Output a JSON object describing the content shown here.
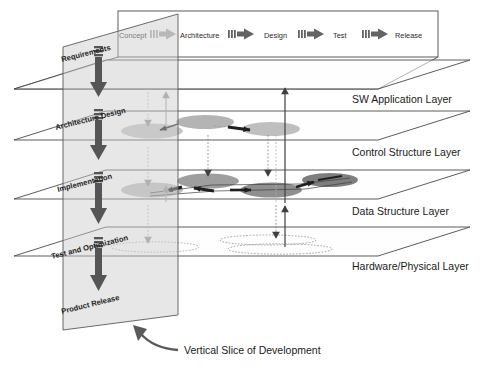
{
  "diagram": {
    "title": "Vertical Slice of Development",
    "caption": "Vertical Slice of Development",
    "colors": {
      "outline": "#4a4a4a",
      "plane_fill": "#fdfdfd",
      "slice_fill": "#e8e8e8",
      "node_light": "#c9c9c9",
      "node_mid": "#a8a8a8",
      "node_dark": "#808080",
      "arrow_dark": "#5a5a5a",
      "arrow_light": "#b5b5b5",
      "text": "#1a1a1a"
    }
  },
  "process_flow": {
    "steps": [
      {
        "label": "Concept",
        "faded": true
      },
      {
        "label": "Architecture",
        "faded": false
      },
      {
        "label": "Design",
        "faded": false
      },
      {
        "label": "Test",
        "faded": false
      },
      {
        "label": "Release",
        "faded": false
      }
    ],
    "connector_count": 4
  },
  "vertical_slice": {
    "stages": [
      {
        "label": "Requirements"
      },
      {
        "label": "Architecture Design"
      },
      {
        "label": "Implementation"
      },
      {
        "label": "Test and Optimization"
      },
      {
        "label": "Product Release"
      }
    ]
  },
  "layers": [
    {
      "label": "SW Application Layer"
    },
    {
      "label": "Control Structure Layer"
    },
    {
      "label": "Data Structure Layer"
    },
    {
      "label": "Hardware/Physical  Layer"
    }
  ]
}
